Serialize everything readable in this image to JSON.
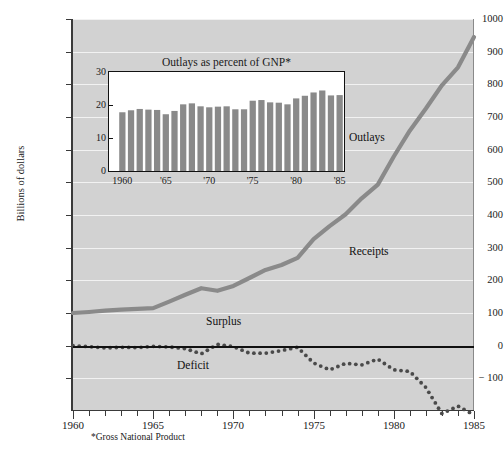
{
  "figure": {
    "ylabel": "Billions of dollars",
    "footnote": "*Gross National Product"
  },
  "chart_data": [
    {
      "type": "line",
      "name": "main",
      "title": "",
      "xlabel": "",
      "ylabel": "Billions of dollars",
      "xlim": [
        1960,
        1985
      ],
      "ylim": [
        -200,
        1000
      ],
      "grid": true,
      "legend": "inline-labels",
      "yticks": [
        -100,
        0,
        100,
        200,
        300,
        400,
        500,
        600,
        700,
        800,
        900,
        1000
      ],
      "ytick_labels": [
        "− 100",
        "0",
        "100",
        "200",
        "300",
        "400",
        "500",
        "600",
        "700",
        "800",
        "900",
        "1000"
      ],
      "xticks": [
        1960,
        1965,
        1970,
        1975,
        1980,
        1985
      ],
      "xtick_labels": [
        "1960",
        "1965",
        "1970",
        "1975",
        "1980",
        "1985"
      ],
      "annotations": [
        {
          "text": "Outlays",
          "x": 1977.2,
          "y": 640
        },
        {
          "text": "Receipts",
          "x": 1977.2,
          "y": 290
        },
        {
          "text": "Surplus",
          "x": 1968.3,
          "y": 75
        },
        {
          "text": "Deficit",
          "x": 1966.5,
          "y": -60
        }
      ],
      "series": [
        {
          "name": "Outlays / Receipts",
          "style": "thick-gray-line",
          "color": "#8a8a8a",
          "x": [
            1960,
            1961,
            1962,
            1963,
            1964,
            1965,
            1966,
            1967,
            1968,
            1969,
            1970,
            1971,
            1972,
            1973,
            1974,
            1975,
            1976,
            1977,
            1978,
            1979,
            1980,
            1981,
            1982,
            1983,
            1984,
            1985
          ],
          "values": [
            100,
            103,
            107,
            110,
            113,
            115,
            135,
            156,
            176,
            168,
            183,
            207,
            232,
            247,
            269,
            326,
            366,
            402,
            451,
            493,
            579,
            658,
            726,
            797,
            852,
            945
          ]
        },
        {
          "name": "Surplus or Deficit",
          "style": "dotted-line",
          "color": "#4a4a4a",
          "x": [
            1960,
            1961,
            1962,
            1963,
            1964,
            1965,
            1966,
            1967,
            1968,
            1969,
            1970,
            1971,
            1972,
            1973,
            1974,
            1975,
            1976,
            1977,
            1978,
            1979,
            1980,
            1981,
            1982,
            1983,
            1984,
            1985
          ],
          "values": [
            0,
            -3,
            -7,
            -5,
            -6,
            -2,
            -4,
            -9,
            -25,
            4,
            -3,
            -23,
            -23,
            -15,
            -5,
            -53,
            -74,
            -54,
            -59,
            -41,
            -74,
            -79,
            -128,
            -208,
            -185,
            -212
          ]
        }
      ]
    },
    {
      "type": "bar",
      "name": "inset",
      "title": "Outlays as percent of GNP*",
      "xlabel": "",
      "ylabel": "",
      "ylim": [
        0,
        30
      ],
      "yticks": [
        0,
        10,
        20,
        30
      ],
      "ytick_labels": [
        "0",
        "10",
        "20",
        "30"
      ],
      "grid": false,
      "bar_color": "#8a8a8a",
      "categories": [
        "1960",
        "1961",
        "1962",
        "1963",
        "1964",
        "1965",
        "1966",
        "1967",
        "1968",
        "1969",
        "1970",
        "1971",
        "1972",
        "1973",
        "1974",
        "1975",
        "1976",
        "1977",
        "1978",
        "1979",
        "1980",
        "1981",
        "1982",
        "1983",
        "1984",
        "1985"
      ],
      "xtick_labels": [
        "1960",
        "'65",
        "'70",
        "'75",
        "'80",
        "'85"
      ],
      "values": [
        17.8,
        18.4,
        18.8,
        18.6,
        18.5,
        17.2,
        18.2,
        20.2,
        20.5,
        19.6,
        19.3,
        19.5,
        19.6,
        18.7,
        18.7,
        21.3,
        21.5,
        20.8,
        20.7,
        20.2,
        22.0,
        22.8,
        23.8,
        24.4,
        22.9,
        23.0
      ]
    }
  ],
  "labels": {
    "outlays": "Outlays",
    "receipts": "Receipts",
    "surplus": "Surplus",
    "deficit": "Deficit"
  }
}
